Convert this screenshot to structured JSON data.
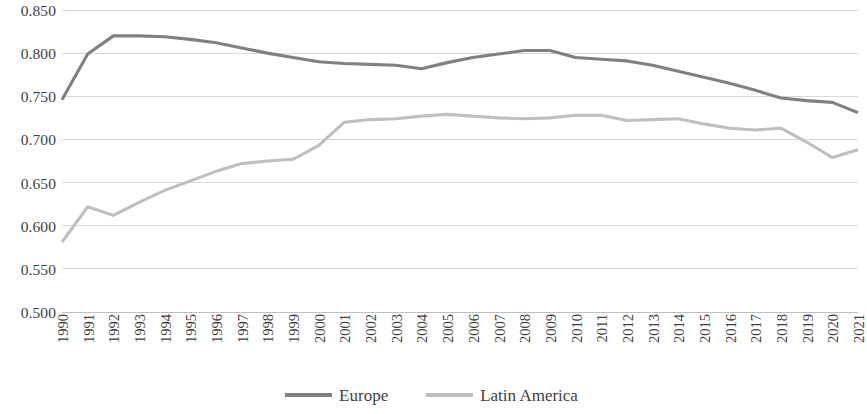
{
  "chart_data": {
    "type": "line",
    "title": "",
    "subtitle": "",
    "xlabel": "",
    "ylabel": "",
    "ylim": [
      0.5,
      0.85
    ],
    "ytick_labels": [
      "0.850",
      "0.800",
      "0.750",
      "0.700",
      "0.650",
      "0.600",
      "0.550",
      "0.500"
    ],
    "ytick_values": [
      0.85,
      0.8,
      0.75,
      0.7,
      0.65,
      0.6,
      0.55,
      0.5
    ],
    "ytick_interval": 0.05,
    "grid": "horizontal",
    "legend_position": "bottom-center",
    "categories": [
      "1990",
      "1991",
      "1992",
      "1993",
      "1994",
      "1995",
      "1996",
      "1997",
      "1998",
      "1999",
      "2000",
      "2001",
      "2002",
      "2003",
      "2004",
      "2005",
      "2006",
      "2007",
      "2008",
      "2009",
      "2010",
      "2011",
      "2012",
      "2013",
      "2014",
      "2015",
      "2016",
      "2017",
      "2018",
      "2019",
      "2020",
      "2021"
    ],
    "series": [
      {
        "name": "Europe",
        "color": "#808080",
        "values": [
          0.746,
          0.799,
          0.82,
          0.82,
          0.819,
          0.816,
          0.812,
          0.806,
          0.8,
          0.795,
          0.79,
          0.788,
          0.787,
          0.786,
          0.782,
          0.789,
          0.795,
          0.799,
          0.803,
          0.803,
          0.795,
          0.793,
          0.791,
          0.786,
          0.779,
          0.772,
          0.765,
          0.757,
          0.748,
          0.745,
          0.743,
          0.731
        ]
      },
      {
        "name": "Latin America",
        "color": "#bfbfbf",
        "values": [
          0.581,
          0.622,
          0.612,
          0.627,
          0.641,
          0.652,
          0.663,
          0.672,
          0.675,
          0.677,
          0.693,
          0.72,
          0.723,
          0.724,
          0.727,
          0.729,
          0.727,
          0.725,
          0.724,
          0.725,
          0.728,
          0.728,
          0.722,
          0.723,
          0.724,
          0.718,
          0.713,
          0.711,
          0.713,
          0.697,
          0.679,
          0.688
        ]
      }
    ]
  },
  "legend": {
    "entries": [
      {
        "label": "Europe",
        "swatch_name": "legend-swatch-europe"
      },
      {
        "label": "Latin America",
        "swatch_name": "legend-swatch-latin-america"
      }
    ]
  }
}
